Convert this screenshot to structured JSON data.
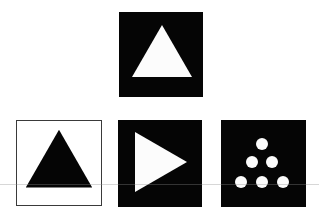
{
  "figure": {
    "stimulus": {
      "shape": "triangle-up",
      "shape_color": "#ffffff",
      "background_color": "#050505"
    },
    "options": [
      {
        "id": "a",
        "shape": "triangle-up",
        "shape_color": "#050505",
        "background_color": "#ffffff",
        "border_color": "#3a3a3a"
      },
      {
        "id": "b",
        "shape": "triangle-right",
        "shape_color": "#ffffff",
        "background_color": "#050505"
      },
      {
        "id": "c",
        "shape": "dot-triangle",
        "dot_count": 6,
        "dot_rows": [
          1,
          2,
          3
        ],
        "shape_color": "#ffffff",
        "background_color": "#050505"
      }
    ]
  }
}
